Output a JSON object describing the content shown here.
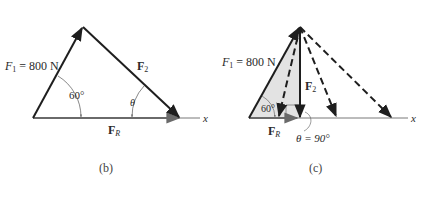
{
  "colors": {
    "ink": "#1e1e1e",
    "axis": "#555555",
    "resultant": "#6a6a6a",
    "shade": "#e3e3e3",
    "background": "#ffffff"
  },
  "panel_b": {
    "caption": "(b)",
    "f1_label": "F",
    "f1_sub": "1",
    "f1_value": " = 800 N",
    "f2_label": "F",
    "f2_sub": "2",
    "fr_label": "F",
    "fr_sub": "R",
    "angle_60": "60°",
    "angle_theta": "θ",
    "axis_label": "x"
  },
  "panel_c": {
    "caption": "(c)",
    "f1_label": "F",
    "f1_sub": "1",
    "f1_value": " = 800 N",
    "f2_label": "F",
    "f2_sub": "2",
    "fr_label": "F",
    "fr_sub": "R",
    "angle_60": "60°",
    "theta_eq": "θ = 90°",
    "axis_label": "x"
  }
}
